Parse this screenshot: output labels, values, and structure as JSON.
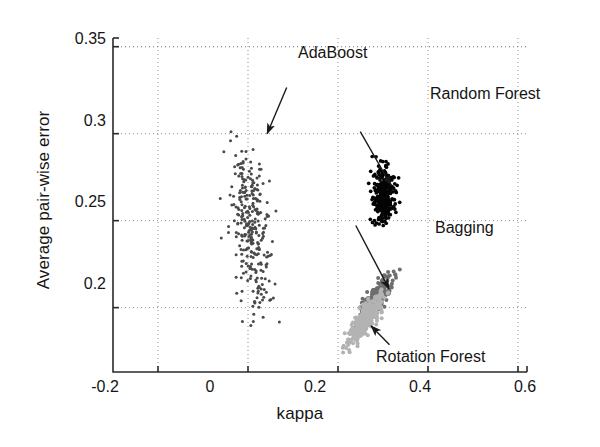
{
  "chart_data": {
    "type": "scatter",
    "title": "",
    "xlabel": "kappa",
    "ylabel": "Average pair-wise error",
    "xlim": [
      -0.3,
      0.62
    ],
    "ylim": [
      0.163,
      0.355
    ],
    "xticks": [
      "-0.2",
      "0",
      "0.2",
      "0.4",
      "0.6"
    ],
    "xtick_values": [
      -0.2,
      0,
      0.2,
      0.4,
      0.6
    ],
    "yticks": [
      "0.2",
      "0.25",
      "0.3",
      "0.35"
    ],
    "ytick_values": [
      0.2,
      0.25,
      0.3,
      0.35
    ],
    "grid": "dotted-gray-both-axes",
    "legend": "none-inline-annotations",
    "series": [
      {
        "name": "AdaBoost",
        "color": "#4a4a4a",
        "marker": "dot",
        "n": 300,
        "center": [
          0.005,
          0.247
        ],
        "spread": [
          0.022,
          0.024
        ],
        "x_range": [
          -0.065,
          0.085
        ],
        "y_range": [
          0.183,
          0.302
        ]
      },
      {
        "name": "Random Forest",
        "color": "#050505",
        "marker": "dot",
        "n": 300,
        "center": [
          0.303,
          0.2635
        ],
        "spread": [
          0.0115,
          0.0075
        ],
        "x_range": [
          0.26,
          0.355
        ],
        "y_range": [
          0.243,
          0.288
        ]
      },
      {
        "name": "Bagging",
        "color": "#6e6e6e",
        "marker": "dot",
        "n": 320,
        "center": [
          0.282,
          0.2045
        ],
        "spread": [
          0.0185,
          0.0068
        ],
        "x_range": [
          0.225,
          0.355
        ],
        "y_range": [
          0.185,
          0.222
        ]
      },
      {
        "name": "Rotation Forest",
        "color": "#b3b3b3",
        "marker": "dot",
        "n": 340,
        "center": [
          0.262,
          0.1935
        ],
        "spread": [
          0.0185,
          0.0065
        ],
        "x_range": [
          0.205,
          0.33
        ],
        "y_range": [
          0.173,
          0.211
        ]
      }
    ],
    "annotations": [
      {
        "label": "AdaBoost",
        "label_x": 0.0955,
        "label_y": 0.3345,
        "arrow_from": [
          0.086,
          0.3265
        ],
        "arrow_to": [
          0.0425,
          0.3
        ],
        "anchor": "left"
      },
      {
        "label": "Random Forest",
        "label_x": 0.2325,
        "label_y": 0.3085,
        "arrow_from": [
          0.2495,
          0.3012
        ],
        "arrow_to": [
          0.3175,
          0.2705
        ],
        "anchor": "left"
      },
      {
        "label": "Bagging",
        "label_x": 0.2415,
        "label_y": 0.2545,
        "arrow_from": [
          0.2395,
          0.2472
        ],
        "arrow_to": [
          0.3135,
          0.2108
        ],
        "anchor": "left"
      },
      {
        "label": "Rotation Forest",
        "label_x": 0.3195,
        "label_y": 0.1755,
        "arrow_from": [
          0.3145,
          0.1787
        ],
        "arrow_to": [
          0.2735,
          0.1895
        ],
        "anchor": "left"
      }
    ]
  },
  "axes": {
    "xtick_0": "-0.2",
    "xtick_1": "0",
    "xtick_2": "0.2",
    "xtick_3": "0.4",
    "xtick_4": "0.6",
    "ytick_0": "0.2",
    "ytick_1": "0.25",
    "ytick_2": "0.3",
    "ytick_3": "0.35",
    "xlabel": "kappa",
    "ylabel": "Average pair-wise error"
  },
  "annotations": {
    "adaboost": "AdaBoost",
    "random_forest": "Random Forest",
    "bagging": "Bagging",
    "rotation_forest": "Rotation Forest"
  }
}
